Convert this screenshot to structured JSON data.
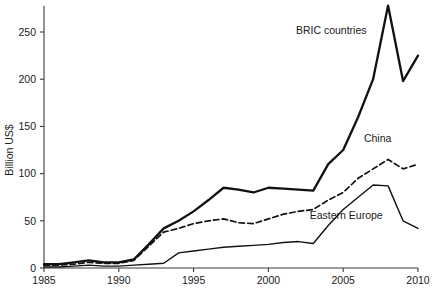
{
  "chart_data": {
    "type": "line",
    "title": "",
    "xlabel": "",
    "ylabel": "Billion US$",
    "xlim": [
      1985,
      2010
    ],
    "ylim": [
      0,
      275
    ],
    "xticks": [
      1985,
      1990,
      1995,
      2000,
      2005,
      2010
    ],
    "yticks": [
      0,
      50,
      100,
      150,
      200,
      250
    ],
    "grid": false,
    "legend_position": "inline-annotations",
    "x": [
      1985,
      1986,
      1987,
      1988,
      1989,
      1990,
      1991,
      1992,
      1993,
      1994,
      1995,
      1996,
      1997,
      1998,
      1999,
      2000,
      2001,
      2002,
      2003,
      2004,
      2005,
      2006,
      2007,
      2008,
      2009,
      2010
    ],
    "series": [
      {
        "name": "BRIC countries",
        "style": "solid-thick",
        "values": [
          4,
          4,
          6,
          8,
          6,
          6,
          9,
          25,
          42,
          50,
          60,
          72,
          85,
          83,
          80,
          85,
          84,
          83,
          82,
          110,
          125,
          160,
          200,
          278,
          198,
          225
        ]
      },
      {
        "name": "China",
        "style": "dashed",
        "values": [
          3,
          3,
          4,
          6,
          5,
          5,
          8,
          23,
          38,
          42,
          47,
          50,
          52,
          48,
          47,
          52,
          57,
          60,
          62,
          72,
          80,
          95,
          105,
          115,
          105,
          110
        ]
      },
      {
        "name": "Eastern Europe",
        "style": "solid-thin",
        "values": [
          1,
          1,
          2,
          3,
          2,
          2,
          3,
          4,
          5,
          16,
          18,
          20,
          22,
          23,
          24,
          25,
          27,
          28,
          26,
          45,
          62,
          75,
          88,
          87,
          50,
          42
        ]
      }
    ],
    "annotations": [
      {
        "text": "BRIC countries",
        "x": 2004.2,
        "y": 248
      },
      {
        "text": "China",
        "x": 2007.3,
        "y": 133
      },
      {
        "text": "Eastern Europe",
        "x": 2005.2,
        "y": 52
      }
    ]
  }
}
